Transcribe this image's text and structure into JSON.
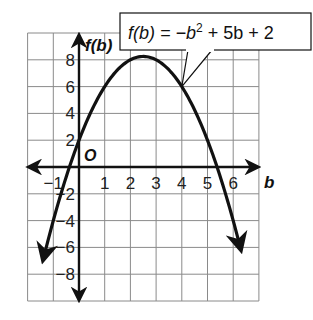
{
  "chart_data": {
    "type": "line",
    "title": "",
    "function": "f(b) = -b^2 + 5b + 2",
    "coefficients": {
      "a": -1,
      "b": 5,
      "c": 2
    },
    "xlabel": "b",
    "ylabel": "f(b)",
    "origin_label": "O",
    "xlim": [
      -2,
      7
    ],
    "ylim": [
      -10,
      10
    ],
    "grid": true,
    "x_grid_step": 1,
    "y_grid_step": 2,
    "x_ticks": [
      -1,
      1,
      2,
      3,
      4,
      5,
      6
    ],
    "y_ticks": [
      -8,
      -6,
      -4,
      -2,
      2,
      4,
      6,
      8
    ],
    "x_tick_labels": [
      "−1",
      "1",
      "2",
      "3",
      "4",
      "5",
      "6"
    ],
    "y_tick_labels": [
      "−8",
      "−6",
      "−4",
      "−2",
      "2",
      "4",
      "6",
      "8"
    ],
    "vertex": {
      "x": 2.5,
      "y": 8.25
    },
    "x_intercepts": [
      -0.37,
      5.37
    ],
    "y_intercept": 2,
    "plot_domain": [
      -1.4,
      6.3
    ],
    "annotation": {
      "text_parts": [
        "f(b) = −b",
        "2",
        " + 5b + 2"
      ],
      "points_to": {
        "x": 4,
        "y": 6
      }
    },
    "legend": "none",
    "colors": {
      "curve": "#111111",
      "grid": "#8a8a8a",
      "axis": "#111111",
      "background": "#ffffff"
    }
  }
}
